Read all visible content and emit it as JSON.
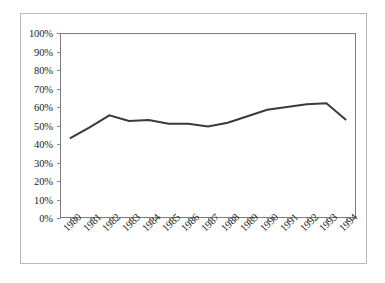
{
  "chart_data": {
    "type": "line",
    "title": "",
    "subtitle": "",
    "xlabel": "",
    "ylabel": "",
    "categories": [
      "1980",
      "1981",
      "1982",
      "1983",
      "1984",
      "1985",
      "1986",
      "1987",
      "1988",
      "1989",
      "1990",
      "1991",
      "1992",
      "1993",
      "1994"
    ],
    "series": [
      {
        "name": "",
        "values": [
          43,
          49,
          55.5,
          52.5,
          53,
          51,
          51,
          49.5,
          51.5,
          55,
          58.5,
          60,
          61.5,
          62,
          53
        ]
      }
    ],
    "ylim": [
      0,
      100
    ],
    "ytick_values": [
      0,
      10,
      20,
      30,
      40,
      50,
      60,
      70,
      80,
      90,
      100
    ],
    "ytick_labels": [
      "0%",
      "10%",
      "20%",
      "30%",
      "40%",
      "50%",
      "60%",
      "70%",
      "80%",
      "90%",
      "100%"
    ],
    "grid": false,
    "legend": "none",
    "value_format": "percent",
    "line_color": "#3a3a3a",
    "axis_color": "#7d7d7d",
    "frame_color": "#b8b8b8",
    "plot_background": "#ffffff"
  }
}
